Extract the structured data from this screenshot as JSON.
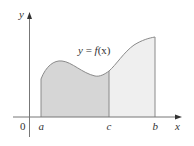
{
  "diagram": {
    "type": "area-under-curve",
    "curve_label": "y = f(x)",
    "curve_label_parts": {
      "lhs": "y",
      "eq": " = ",
      "fname": "f",
      "arg": "(x)"
    },
    "axes": {
      "x_label": "x",
      "y_label": "y",
      "origin_label": "0"
    },
    "points": {
      "a": "a",
      "c": "c",
      "b": "b"
    },
    "regions": [
      {
        "name": "left-region",
        "from": "a",
        "to": "c",
        "fill": "#d6d6d6"
      },
      {
        "name": "right-region",
        "from": "c",
        "to": "b",
        "fill": "#efefef"
      }
    ],
    "colors": {
      "stroke": "#8a8a8a",
      "axis": "#555555",
      "text": "#333333",
      "left_fill": "#d6d6d6",
      "right_fill": "#efefef"
    }
  }
}
